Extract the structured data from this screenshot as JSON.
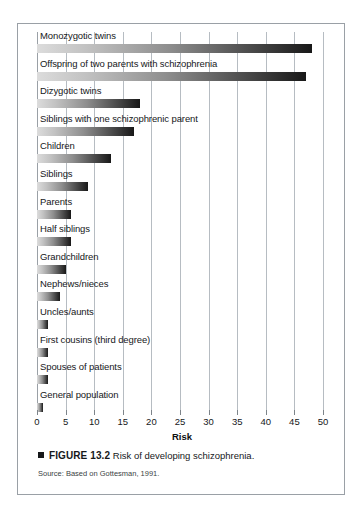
{
  "figure": {
    "caption_marker": "square-bullet",
    "figure_number": "FIGURE 13.2",
    "caption_text": "Risk of developing schizophrenia.",
    "source": "Source: Based on Gottesman, 1991."
  },
  "chart_data": {
    "type": "bar",
    "orientation": "horizontal",
    "title": "",
    "xlabel": "Risk",
    "ylabel": "",
    "xlim": [
      0,
      50
    ],
    "xticks": [
      0,
      5,
      10,
      15,
      20,
      25,
      30,
      35,
      40,
      45,
      50
    ],
    "tick_labels": [
      "0",
      "5",
      "10",
      "15",
      "20",
      "25",
      "30",
      "35",
      "40",
      "45",
      "50"
    ],
    "grid": true,
    "legend": "none",
    "bar_style": "gradient-light-to-dark",
    "bar_color_start": "#dcdcdc",
    "bar_color_end": "#181818",
    "categories": [
      "Monozygotic twins",
      "Offspring of two parents with schizophrenia",
      "Dizygotic twins",
      "Siblings with one schizophrenic parent",
      "Children",
      "Siblings",
      "Parents",
      "Half siblings",
      "Grandchildren",
      "Nephews/nieces",
      "Uncles/aunts",
      "First cousins (third degree)",
      "Spouses of patients",
      "General population"
    ],
    "values": [
      48,
      47,
      18,
      17,
      13,
      9,
      6,
      6,
      5,
      4,
      2,
      2,
      2,
      1
    ]
  }
}
